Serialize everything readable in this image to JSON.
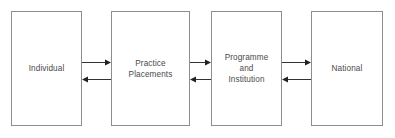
{
  "figure": {
    "background_color": "#ffffff",
    "box_border_color": "#8d8d8d",
    "text_color": "#4a4a4a",
    "arrow_color": "#333333",
    "width": 395,
    "height": 138
  },
  "nodes": [
    {
      "id": "individual",
      "label": "Individual",
      "x": 11,
      "y": 11,
      "width": 71,
      "height": 115
    },
    {
      "id": "practice-placements",
      "label": "Practice\nPlacements",
      "x": 111,
      "y": 11,
      "width": 79,
      "height": 115
    },
    {
      "id": "programme-and-institution",
      "label": "Programme\nand\nInstitution",
      "x": 211,
      "y": 11,
      "width": 71,
      "height": 115
    },
    {
      "id": "national",
      "label": "National",
      "x": 311,
      "y": 11,
      "width": 72,
      "height": 115
    }
  ],
  "edges": [
    {
      "id": "individual-to-practice-placements",
      "from": "individual",
      "to": "practice-placements",
      "direction": "right",
      "x1": 82,
      "x2": 111,
      "y": 62
    },
    {
      "id": "practice-placements-to-individual",
      "from": "practice-placements",
      "to": "individual",
      "direction": "left",
      "x1": 111,
      "x2": 82,
      "y": 79
    },
    {
      "id": "practice-placements-to-programme",
      "from": "practice-placements",
      "to": "programme-and-institution",
      "direction": "right",
      "x1": 190,
      "x2": 211,
      "y": 62
    },
    {
      "id": "programme-to-practice-placements",
      "from": "programme-and-institution",
      "to": "practice-placements",
      "direction": "left",
      "x1": 211,
      "x2": 190,
      "y": 79
    },
    {
      "id": "programme-to-national",
      "from": "programme-and-institution",
      "to": "national",
      "direction": "right",
      "x1": 282,
      "x2": 311,
      "y": 62
    },
    {
      "id": "national-to-programme",
      "from": "national",
      "to": "programme-and-institution",
      "direction": "left",
      "x1": 311,
      "x2": 282,
      "y": 79
    }
  ]
}
